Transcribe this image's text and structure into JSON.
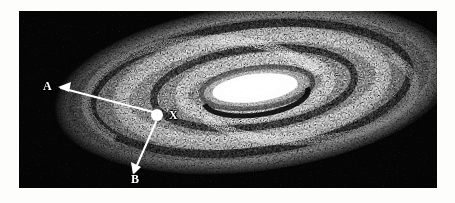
{
  "figure": {
    "domain": "Natural-Image",
    "kind": "vintage-engraving",
    "caption": "",
    "background_color": "#fdfdfc",
    "plate_color": "#050505",
    "ink_color": "#ffffff",
    "plate": {
      "x": 19,
      "y": 11,
      "width": 418,
      "height": 177
    }
  },
  "annotations": {
    "marker_dot": {
      "name": "position-marker-dot",
      "label": "",
      "x": 157,
      "y": 115,
      "radius": 6,
      "color": "#ffffff"
    },
    "labels": [
      {
        "id": "A",
        "text": "A",
        "x": 48,
        "y": 85
      },
      {
        "id": "X",
        "text": "X",
        "x": 172,
        "y": 112
      },
      {
        "id": "B",
        "text": "B",
        "x": 136,
        "y": 180
      }
    ],
    "arrows": [
      {
        "id": "arrow-to-A",
        "from": {
          "x": 153,
          "y": 112
        },
        "to": {
          "x": 58,
          "y": 87
        },
        "head_at": "to",
        "color": "#ffffff"
      },
      {
        "id": "arrow-to-B",
        "from": {
          "x": 155,
          "y": 122
        },
        "to": {
          "x": 133,
          "y": 172
        },
        "head_at": "to",
        "color": "#ffffff"
      }
    ]
  },
  "galaxy": {
    "center": {
      "x": 255,
      "y": 88
    },
    "core": {
      "name": "bright-nucleus",
      "cx": 255,
      "cy": 88,
      "rx": 44,
      "ry": 15,
      "rotation_deg": -7,
      "color": "#ffffff"
    },
    "tilt_deg": -7,
    "rings": [
      {
        "id": "ring-1",
        "rx": 74,
        "ry": 28,
        "band": "bright"
      },
      {
        "id": "ring-2",
        "rx": 104,
        "ry": 40,
        "band": "dark"
      },
      {
        "id": "ring-3",
        "rx": 134,
        "ry": 53,
        "band": "bright"
      },
      {
        "id": "ring-4",
        "rx": 163,
        "ry": 65,
        "band": "dark"
      },
      {
        "id": "ring-5",
        "rx": 192,
        "ry": 78,
        "band": "bright"
      },
      {
        "id": "ring-6",
        "rx": 218,
        "ry": 90,
        "band": "dark"
      }
    ],
    "dust_lanes": 5,
    "stipple_density": "high"
  }
}
